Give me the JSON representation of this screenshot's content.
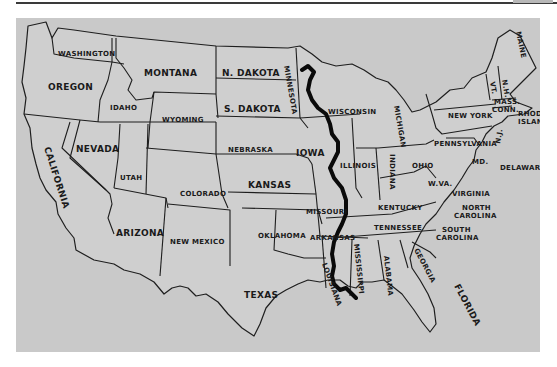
{
  "map": {
    "background_color": "#c9c9c9",
    "line_color": "#1e1e1e",
    "river": {
      "name": "Mississippi River",
      "color": "#0a0a0a",
      "label": "MISSISSIPPI"
    },
    "states": {
      "washington": "WASHINGTON",
      "oregon": "OREGON",
      "california": "CALIFORNIA",
      "nevada": "NEVADA",
      "idaho": "IDAHO",
      "montana": "MONTANA",
      "wyoming": "WYOMING",
      "utah": "UTAH",
      "arizona": "ARIZONA",
      "colorado": "COLORADO",
      "new_mexico": "NEW MEXICO",
      "north_dakota": "N. DAKOTA",
      "south_dakota": "S. DAKOTA",
      "nebraska": "NEBRASKA",
      "kansas": "KANSAS",
      "oklahoma": "OKLAHOMA",
      "texas": "TEXAS",
      "minnesota": "MINNESOTA",
      "iowa": "IOWA",
      "missouri": "MISSOURI",
      "arkansas": "ARKANSAS",
      "louisiana": "LOUISIANA",
      "wisconsin": "WISCONSIN",
      "illinois": "ILLINOIS",
      "michigan": "MICHIGAN",
      "indiana": "INDIANA",
      "ohio": "OHIO",
      "kentucky": "KENTUCKY",
      "tennessee": "TENNESSEE",
      "mississippi": "MISSISSIPPI",
      "alabama": "ALABAMA",
      "georgia": "GEORGIA",
      "florida": "FLORIDA",
      "south_carolina_1": "SOUTH",
      "south_carolina_2": "CAROLINA",
      "north_carolina_1": "NORTH",
      "north_carolina_2": "CAROLINA",
      "virginia": "VIRGINIA",
      "west_virginia": "W.VA.",
      "pennsylvania": "PENNSYLVANIA",
      "new_york": "NEW YORK",
      "maryland": "MD.",
      "delaware": "DELAWARE",
      "new_jersey": "N.J.",
      "vermont": "VT.",
      "new_hampshire": "N.H.",
      "maine": "MAINE",
      "massachusetts": "MASS.",
      "connecticut": "CONN.",
      "rhode_island_1": "RHODE",
      "rhode_island_2": "ISLAND"
    }
  }
}
